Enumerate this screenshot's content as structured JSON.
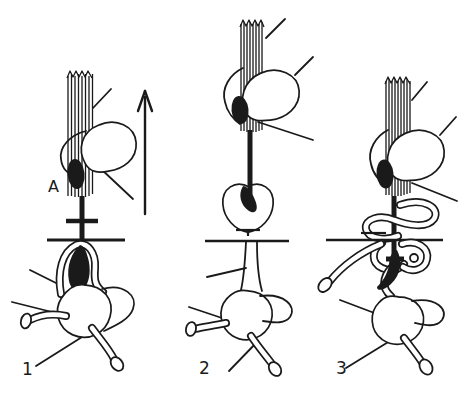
{
  "diagram": {
    "background_color": "#ffffff",
    "ink_color": "#1a1a1a",
    "annotation_label": "A",
    "icons": {
      "direction_arrow": "up-arrow"
    },
    "stages": [
      {
        "label": "1"
      },
      {
        "label": "2"
      },
      {
        "label": "3"
      }
    ]
  }
}
